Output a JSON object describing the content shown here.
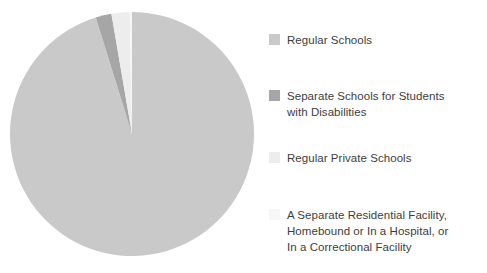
{
  "chart_data": {
    "type": "pie",
    "title": "",
    "subtitle": "",
    "xlabel": "",
    "ylabel": "",
    "grid": false,
    "legend_position": "right",
    "categories": [
      "Regular Schools",
      "Separate Schools for Students\nwith Disabilities",
      "Regular Private Schools",
      "A Separate Residential Facility,\nHomebound or In a Hospital, or\nIn a Correctional Facility"
    ],
    "values": [
      95.2,
      2.1,
      2.4,
      0.3
    ],
    "colors": [
      "#c9c9c9",
      "#a6a6a6",
      "#ededed",
      "#f7f7f7"
    ],
    "start_angle_deg": 0,
    "direction": "clockwise"
  },
  "legend": {
    "items": [
      {
        "label": "Regular Schools",
        "color": "#c9c9c9",
        "swatch_name": "legend-swatch-regular-schools"
      },
      {
        "label": "Separate Schools for Students\nwith Disabilities",
        "color": "#a6a6a6",
        "swatch_name": "legend-swatch-separate-schools"
      },
      {
        "label": "Regular Private Schools",
        "color": "#ededed",
        "swatch_name": "legend-swatch-regular-private-schools"
      },
      {
        "label": "A Separate Residential Facility,\nHomebound or In a Hospital, or\nIn a Correctional Facility",
        "color": "#f7f7f7",
        "swatch_name": "legend-swatch-separate-residential-facility"
      }
    ]
  },
  "pie": {
    "center_x": 122,
    "center_y": 123,
    "radius": 122,
    "background": "#ffffff",
    "text_color": "#3d3d3d"
  }
}
